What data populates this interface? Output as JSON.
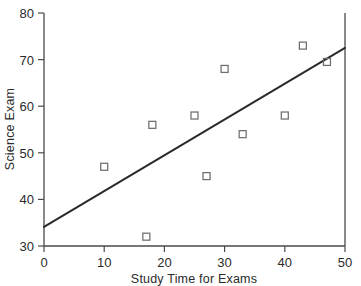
{
  "chart_data": {
    "type": "scatter",
    "title": "",
    "xlabel": "Study Time for Exams",
    "ylabel": "Science Exam",
    "xlim": [
      0,
      50
    ],
    "ylim": [
      30,
      80
    ],
    "xticks": [
      0,
      10,
      20,
      30,
      40,
      50
    ],
    "yticks": [
      30,
      40,
      50,
      60,
      70,
      80
    ],
    "xtick_labels": [
      "0",
      "10",
      "20",
      "30",
      "40",
      "50"
    ],
    "ytick_labels": [
      "30",
      "40",
      "50",
      "60",
      "70",
      "80"
    ],
    "grid": false,
    "legend": false,
    "points": [
      {
        "x": 10,
        "y": 47
      },
      {
        "x": 17,
        "y": 32
      },
      {
        "x": 18,
        "y": 56
      },
      {
        "x": 25,
        "y": 58
      },
      {
        "x": 27,
        "y": 45
      },
      {
        "x": 30,
        "y": 68
      },
      {
        "x": 33,
        "y": 54
      },
      {
        "x": 40,
        "y": 58
      },
      {
        "x": 43,
        "y": 73
      },
      {
        "x": 47,
        "y": 69.5
      }
    ],
    "trendline": {
      "name": "least-squares fit",
      "x": [
        0,
        50
      ],
      "y": [
        34.1,
        72.5
      ]
    },
    "marker_style": "open-square",
    "marker_color": "#6e6e6e",
    "trendline_color": "#2a2a2a",
    "axis_color": "#4a4a4a",
    "background_color": "#ffffff"
  }
}
